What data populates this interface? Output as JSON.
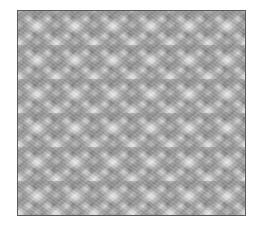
{
  "image": {
    "subject": "grayscale photograph of a textured knitted/crocheted fabric stitch pattern",
    "colors": {
      "background": "#ffffff",
      "frame_border": "#5a5a5a",
      "texture_base": "#9a9a9a",
      "highlight": "#e6e6e6",
      "shadow": "#505050"
    }
  }
}
